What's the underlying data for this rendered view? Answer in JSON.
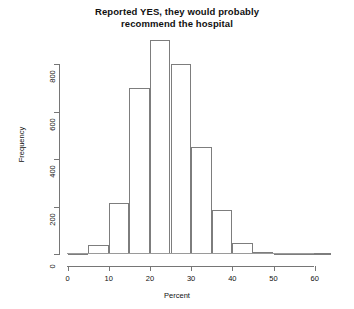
{
  "chart_data": {
    "type": "bar",
    "title": "Reported YES, they would probably recommend the hospital",
    "title_line1": "Reported YES, they would probably",
    "title_line2": "recommend the hospital",
    "xlabel": "Percent",
    "ylabel": "Frequency",
    "xlim": [
      0,
      64
    ],
    "ylim": [
      0,
      860
    ],
    "xticks": [
      0,
      10,
      20,
      30,
      40,
      50,
      60
    ],
    "xtick_labels": [
      "0",
      "10",
      "20",
      "30",
      "40",
      "50",
      "60"
    ],
    "yticks": [
      0,
      200,
      400,
      600,
      800
    ],
    "ytick_labels": [
      "0",
      "200",
      "400",
      "600",
      "800"
    ],
    "grid": false,
    "legend": false,
    "bin_width": 5,
    "bin_edges": [
      0,
      5,
      10,
      15,
      20,
      25,
      30,
      35,
      40,
      45,
      50,
      55,
      60,
      64
    ],
    "categories": [
      "0-5",
      "5-10",
      "10-15",
      "15-20",
      "20-25",
      "25-30",
      "30-35",
      "35-40",
      "40-45",
      "45-50",
      "50-55",
      "55-60",
      "60-64"
    ],
    "values": [
      5,
      40,
      215,
      700,
      900,
      800,
      450,
      185,
      45,
      8,
      2,
      1,
      2
    ],
    "bar_color": "#ffffff",
    "bar_edge_color": "#7d7d7d",
    "axis_color": "#767676",
    "background": "#ffffff"
  },
  "axes": {
    "y_title": "Frequency",
    "x_title": "Percent"
  }
}
